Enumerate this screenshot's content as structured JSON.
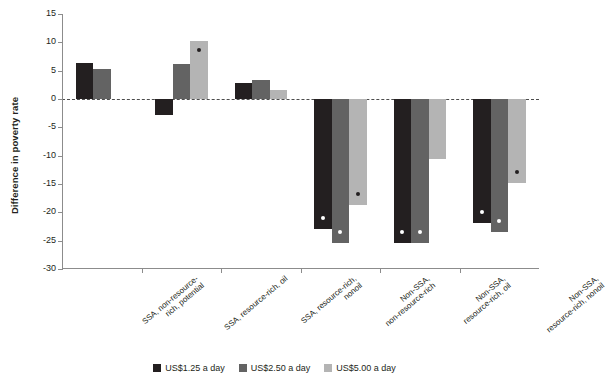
{
  "chart_data": {
    "type": "bar",
    "title": "",
    "xlabel": "",
    "ylabel": "Difference in poverty rate",
    "ylim": [
      -30,
      15
    ],
    "yticks": [
      15,
      10,
      5,
      0,
      -5,
      -10,
      -15,
      -20,
      -25,
      -30
    ],
    "ytick_labels": [
      "15",
      "10",
      "5",
      "0",
      "-5",
      "-10",
      "-15",
      "-20",
      "-25",
      "-30"
    ],
    "grid": false,
    "zero_line": true,
    "legend_position": "bottom",
    "categories": [
      "SSA, non-resource-\nrich, potential",
      "SSA, resource-rich, oil",
      "SSA, resource-rich,\nnonoil",
      "Non-SSA,\nnon-resource-rich",
      "Non-SSA,\nresource-rich, oil",
      "Non-SSA,\nresource-rich, nonoil"
    ],
    "series": [
      {
        "name": "US$1.25 a day",
        "color": "#231f20",
        "values": [
          6.4,
          -2.9,
          2.9,
          -23.0,
          -25.4,
          -21.8
        ],
        "significant": [
          false,
          false,
          false,
          true,
          true,
          true
        ]
      },
      {
        "name": "US$2.50 a day",
        "color": "#636363",
        "values": [
          5.3,
          6.2,
          3.4,
          -25.4,
          -25.4,
          -23.5
        ],
        "significant": [
          false,
          false,
          false,
          true,
          true,
          true
        ]
      },
      {
        "name": "US$5.00 a day",
        "color": "#b4b4b4",
        "values": [
          0.0,
          10.2,
          1.6,
          -18.7,
          -10.6,
          -14.9
        ],
        "significant": [
          false,
          true,
          false,
          true,
          false,
          true
        ]
      }
    ]
  },
  "legend": {
    "items": [
      {
        "label": "US$1.25 a day"
      },
      {
        "label": "US$2.50 a day"
      },
      {
        "label": "US$5.00 a day"
      }
    ]
  },
  "axis": {
    "y_title": "Difference in poverty rate"
  }
}
